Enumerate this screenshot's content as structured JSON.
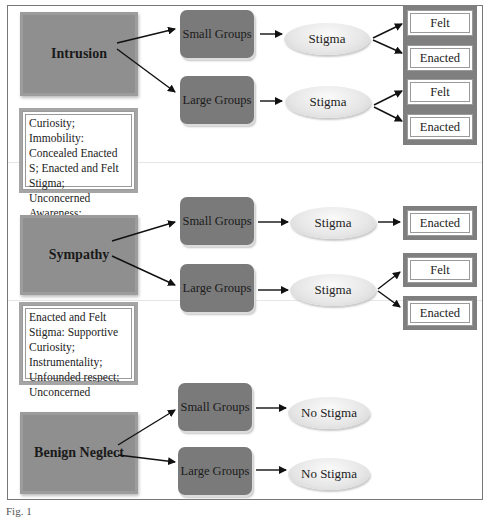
{
  "diagram": {
    "categories": [
      {
        "label": "Intrusion",
        "note": "Curiosity; Immobility: Concealed Enacted S; Enacted and Felt Stigma; Unconcerned Awareness; Resentment",
        "groups": [
          {
            "label": "Small Groups",
            "result": "Stigma",
            "outcomes": [
              "Felt",
              "Enacted"
            ]
          },
          {
            "label": "Large Groups",
            "result": "Stigma",
            "outcomes": [
              "Felt",
              "Enacted"
            ]
          }
        ]
      },
      {
        "label": "Sympathy",
        "note": "Enacted and Felt Stigma: Supportive Curiosity; Instrumentality; Unfounded respect; Unconcerned",
        "groups": [
          {
            "label": "Small Groups",
            "result": "Stigma",
            "outcomes": [
              "Enacted"
            ]
          },
          {
            "label": "Large Groups",
            "result": "Stigma",
            "outcomes": [
              "Felt",
              "Enacted"
            ]
          }
        ]
      },
      {
        "label": "Benign Neglect",
        "groups": [
          {
            "label": "Small Groups",
            "result": "No Stigma",
            "outcomes": []
          },
          {
            "label": "Large Groups",
            "result": "No Stigma",
            "outcomes": []
          }
        ]
      }
    ],
    "caption": "Fig. 1"
  },
  "colors": {
    "category_fill": "#8f8f8f",
    "group_fill": "#7a7a7a",
    "outcome_frame": "#7f7f7f",
    "ellipse_fill": "#e6e6e6"
  }
}
